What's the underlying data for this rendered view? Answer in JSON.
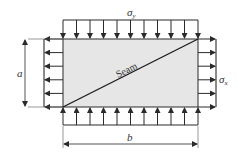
{
  "diagram": {
    "colors": {
      "plate_fill": "#e6e6e6",
      "stroke": "#2a2a2a",
      "text": "#333333"
    },
    "plate": {
      "x": 63,
      "y": 39,
      "width": 135,
      "height": 68
    },
    "seam": {
      "label": "Seam",
      "from": [
        63,
        107
      ],
      "to": [
        198,
        39
      ]
    },
    "loads": {
      "top": {
        "symbol": "σ",
        "subscript": "y",
        "arrow_count": 11,
        "direction": "down"
      },
      "bottom": {
        "arrow_count": 11,
        "direction": "up"
      },
      "left": {
        "arrow_count": 6,
        "direction": "left"
      },
      "right": {
        "symbol": "σ",
        "subscript": "x",
        "arrow_count": 6,
        "direction": "right"
      }
    },
    "dimensions": {
      "height": {
        "label": "a"
      },
      "width": {
        "label": "b"
      }
    }
  }
}
